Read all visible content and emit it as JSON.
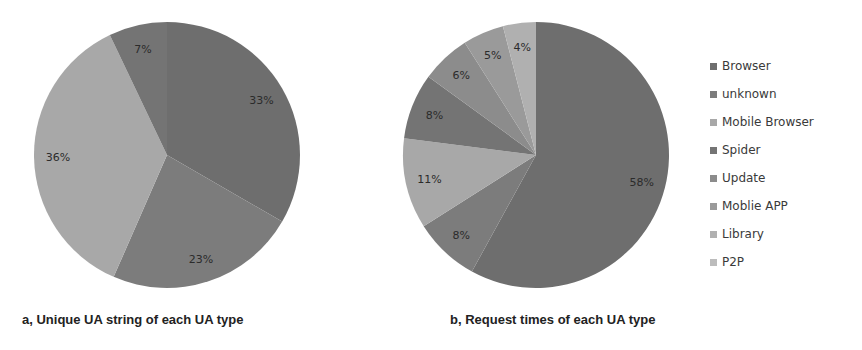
{
  "chart_data": [
    {
      "type": "pie",
      "title": "a, Unique UA string of  each UA type",
      "categories": [
        "Browser",
        "unknown",
        "Mobile Browser",
        "Spider"
      ],
      "values": [
        33,
        23,
        36,
        7
      ],
      "labels": [
        "33%",
        "23%",
        "36%",
        "7%"
      ],
      "start_angle": "12 o'clock, clockwise"
    },
    {
      "type": "pie",
      "title": "b, Request times of  each  UA type",
      "categories": [
        "Browser",
        "unknown",
        "Mobile Browser",
        "Spider",
        "Update",
        "Moblie APP",
        "Library",
        "P2P"
      ],
      "values": [
        58,
        8,
        11,
        8,
        6,
        5,
        4,
        0
      ],
      "labels": [
        "58%",
        "8%",
        "11%",
        "8%",
        "6%",
        "5%",
        "4%",
        ""
      ],
      "start_angle": "12 o'clock, clockwise"
    }
  ],
  "legend": {
    "items": [
      {
        "label": "Browser",
        "color": "#6e6e6e"
      },
      {
        "label": "unknown",
        "color": "#7c7c7c"
      },
      {
        "label": "Mobile Browser",
        "color": "#a8a8a8"
      },
      {
        "label": "Spider",
        "color": "#747474"
      },
      {
        "label": "Update",
        "color": "#8c8c8c"
      },
      {
        "label": "Moblie APP",
        "color": "#9a9a9a"
      },
      {
        "label": "Library",
        "color": "#b0b0b0"
      },
      {
        "label": "P2P",
        "color": "#bcbcbc"
      }
    ]
  },
  "captions": {
    "a": "a, Unique UA string of  each UA type",
    "b": "b, Request times of  each  UA type"
  }
}
